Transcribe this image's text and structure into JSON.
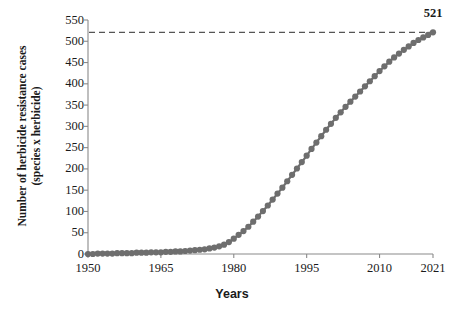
{
  "chart_data": {
    "type": "line",
    "title": "",
    "xlabel": "Years",
    "ylabel": "Number of herbicide resistance cases (species x herbicide)",
    "ylabel_line1": "Number of herbicide resistance cases",
    "ylabel_line2": "(species x herbicide)",
    "xlim": [
      1950,
      2021
    ],
    "ylim": [
      0,
      550
    ],
    "ytick_labels": [
      "0",
      "50",
      "100",
      "150",
      "200",
      "250",
      "300",
      "350",
      "400",
      "450",
      "500",
      "550"
    ],
    "ytick_values": [
      0,
      50,
      100,
      150,
      200,
      250,
      300,
      350,
      400,
      450,
      500,
      550
    ],
    "xtick_labels": [
      "1950",
      "1965",
      "1980",
      "1995",
      "2010",
      "2021"
    ],
    "xtick_values": [
      1950,
      1965,
      1980,
      1995,
      2010,
      2021
    ],
    "grid": false,
    "legend": null,
    "marker": "circle",
    "marker_color": "#6e6e6e",
    "line_color": "#6e6e6e",
    "axis_color": "#8a8a8a",
    "text_color": "#1a1a1a",
    "annotations": [
      {
        "label": "521",
        "x": 2021,
        "y": 521
      }
    ],
    "reference_line": {
      "orientation": "horizontal",
      "value": 521,
      "style": "dashed",
      "color": "#555555"
    },
    "x": [
      1950,
      1951,
      1952,
      1953,
      1954,
      1955,
      1956,
      1957,
      1958,
      1959,
      1960,
      1961,
      1962,
      1963,
      1964,
      1965,
      1966,
      1967,
      1968,
      1969,
      1970,
      1971,
      1972,
      1973,
      1974,
      1975,
      1976,
      1977,
      1978,
      1979,
      1980,
      1981,
      1982,
      1983,
      1984,
      1985,
      1986,
      1987,
      1988,
      1989,
      1990,
      1991,
      1992,
      1993,
      1994,
      1995,
      1996,
      1997,
      1998,
      1999,
      2000,
      2001,
      2002,
      2003,
      2004,
      2005,
      2006,
      2007,
      2008,
      2009,
      2010,
      2011,
      2012,
      2013,
      2014,
      2015,
      2016,
      2017,
      2018,
      2019,
      2020,
      2021
    ],
    "values": [
      0,
      0,
      1,
      1,
      1,
      1,
      2,
      2,
      2,
      2,
      3,
      3,
      3,
      4,
      4,
      4,
      5,
      5,
      6,
      6,
      7,
      8,
      9,
      10,
      11,
      13,
      15,
      18,
      22,
      28,
      36,
      45,
      54,
      64,
      76,
      88,
      101,
      114,
      128,
      142,
      156,
      171,
      186,
      201,
      216,
      231,
      247,
      262,
      277,
      292,
      306,
      320,
      333,
      346,
      358,
      370,
      382,
      394,
      406,
      418,
      430,
      441,
      452,
      462,
      471,
      480,
      488,
      496,
      503,
      509,
      515,
      521
    ]
  }
}
